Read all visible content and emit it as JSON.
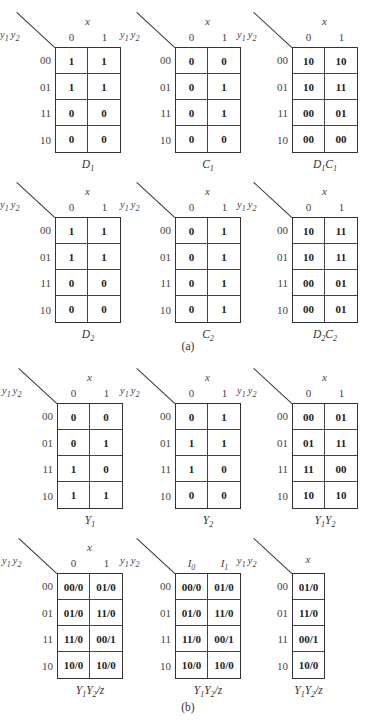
{
  "row_variable_label": "y1 y2",
  "column_variable_label": "x",
  "row_labels": [
    "00",
    "01",
    "11",
    "10"
  ],
  "captions": {
    "a": "(a)",
    "b": "(b)"
  },
  "maps": [
    {
      "id": "D1",
      "title": "D1",
      "cols": [
        "0",
        "1"
      ],
      "cells": [
        [
          "1",
          "1"
        ],
        [
          "1",
          "1"
        ],
        [
          "0",
          "0"
        ],
        [
          "0",
          "0"
        ]
      ]
    },
    {
      "id": "C1",
      "title": "C1",
      "cols": [
        "0",
        "1"
      ],
      "cells": [
        [
          "0",
          "0"
        ],
        [
          "0",
          "1"
        ],
        [
          "0",
          "1"
        ],
        [
          "0",
          "0"
        ]
      ]
    },
    {
      "id": "D1C1",
      "title": "D1C1",
      "cols": [
        "0",
        "1"
      ],
      "cells": [
        [
          "10",
          "10"
        ],
        [
          "10",
          "11"
        ],
        [
          "00",
          "01"
        ],
        [
          "00",
          "00"
        ]
      ]
    },
    {
      "id": "D2",
      "title": "D2",
      "cols": [
        "0",
        "1"
      ],
      "cells": [
        [
          "1",
          "1"
        ],
        [
          "1",
          "1"
        ],
        [
          "0",
          "0"
        ],
        [
          "0",
          "0"
        ]
      ]
    },
    {
      "id": "C2",
      "title": "C2",
      "cols": [
        "0",
        "1"
      ],
      "cells": [
        [
          "0",
          "1"
        ],
        [
          "0",
          "1"
        ],
        [
          "0",
          "1"
        ],
        [
          "0",
          "1"
        ]
      ]
    },
    {
      "id": "D2C2",
      "title": "D2C2",
      "cols": [
        "0",
        "1"
      ],
      "cells": [
        [
          "10",
          "11"
        ],
        [
          "10",
          "11"
        ],
        [
          "00",
          "01"
        ],
        [
          "00",
          "01"
        ]
      ]
    },
    {
      "id": "Y1",
      "title": "Y1",
      "cols": [
        "0",
        "1"
      ],
      "cells": [
        [
          "0",
          "0"
        ],
        [
          "0",
          "1"
        ],
        [
          "1",
          "0"
        ],
        [
          "1",
          "1"
        ]
      ]
    },
    {
      "id": "Y2",
      "title": "Y2",
      "cols": [
        "0",
        "1"
      ],
      "cells": [
        [
          "0",
          "1"
        ],
        [
          "1",
          "1"
        ],
        [
          "1",
          "0"
        ],
        [
          "0",
          "0"
        ]
      ]
    },
    {
      "id": "Y1Y2",
      "title": "Y1Y2",
      "cols": [
        "0",
        "1"
      ],
      "cells": [
        [
          "00",
          "01"
        ],
        [
          "01",
          "11"
        ],
        [
          "11",
          "00"
        ],
        [
          "10",
          "10"
        ]
      ]
    },
    {
      "id": "Y1Y2z_a",
      "title": "Y1Y2/z",
      "cols": [
        "0",
        "1"
      ],
      "cells": [
        [
          "00/0",
          "01/0"
        ],
        [
          "01/0",
          "11/0"
        ],
        [
          "11/0",
          "00/1"
        ],
        [
          "10/0",
          "10/0"
        ]
      ]
    },
    {
      "id": "Y1Y2z_b",
      "title": "Y1Y2/z",
      "cols": [
        "I0",
        "I1"
      ],
      "cells": [
        [
          "00/0",
          "01/0"
        ],
        [
          "01/0",
          "11/0"
        ],
        [
          "11/0",
          "00/1"
        ],
        [
          "10/0",
          "10/0"
        ]
      ]
    },
    {
      "id": "Y1Y2z_c",
      "title": "Y1Y2/z",
      "cols": [],
      "cells": [
        [
          "01/0"
        ],
        [
          "11/0"
        ],
        [
          "00/1"
        ],
        [
          "10/0"
        ]
      ]
    }
  ]
}
